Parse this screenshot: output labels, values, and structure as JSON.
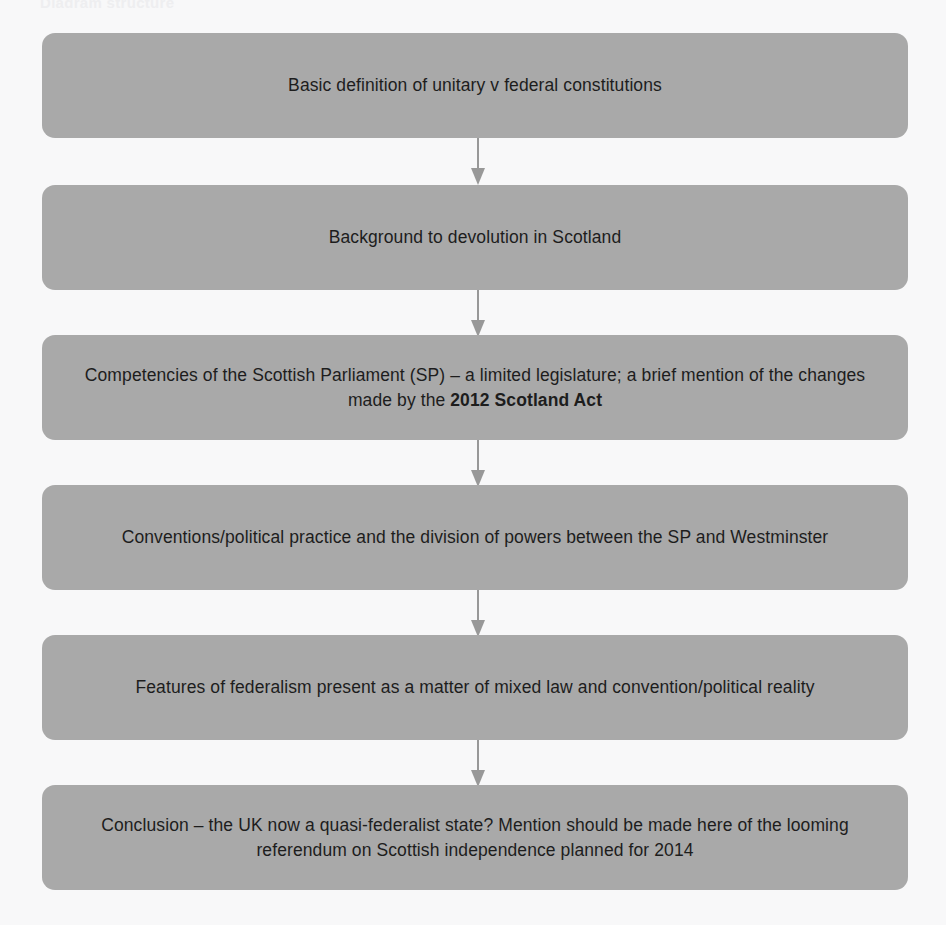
{
  "page": {
    "background_color": "#f8f8f9",
    "top_cut_off_text": "Diagram structure"
  },
  "diagram": {
    "type": "flowchart",
    "orientation": "vertical-top-to-bottom",
    "node_fill_color": "#a9a9a9",
    "node_text_color": "#1d1d1d",
    "connector_color": "#989898",
    "nodes": [
      {
        "id": "node-1",
        "order": 1,
        "text": "Basic definition of unitary v federal constitutions",
        "lines": 1
      },
      {
        "id": "node-2",
        "order": 2,
        "text": "Background to devolution in Scotland",
        "lines": 1
      },
      {
        "id": "node-3",
        "order": 3,
        "text_plain": "Competencies of the Scottish Parliament (SP) – a limited legislature; a brief mention of the changes made by the 2012 Scotland Act",
        "text_prefix": "Competencies of the Scottish Parliament (SP) – a limited legislature; a brief mention of the changes made by the ",
        "text_bold": "2012 Scotland Act",
        "lines": 2
      },
      {
        "id": "node-4",
        "order": 4,
        "text": "Conventions/political practice and the division of powers between the SP and Westminster",
        "lines": 2
      },
      {
        "id": "node-5",
        "order": 5,
        "text": "Features of federalism present as a matter of mixed law and convention/political reality",
        "lines": 2
      },
      {
        "id": "node-6",
        "order": 6,
        "text": "Conclusion – the UK now a quasi-federalist state? Mention should be made here of the looming referendum on Scottish independence planned for 2014",
        "lines": 2
      }
    ],
    "connectors": [
      {
        "id": "connector-1",
        "from": "node-1",
        "to": "node-2",
        "arrow": "down-arrow-icon"
      },
      {
        "id": "connector-2",
        "from": "node-2",
        "to": "node-3",
        "arrow": "down-arrow-icon"
      },
      {
        "id": "connector-3",
        "from": "node-3",
        "to": "node-4",
        "arrow": "down-arrow-icon"
      },
      {
        "id": "connector-4",
        "from": "node-4",
        "to": "node-5",
        "arrow": "down-arrow-icon"
      },
      {
        "id": "connector-5",
        "from": "node-5",
        "to": "node-6",
        "arrow": "down-arrow-icon"
      }
    ]
  }
}
